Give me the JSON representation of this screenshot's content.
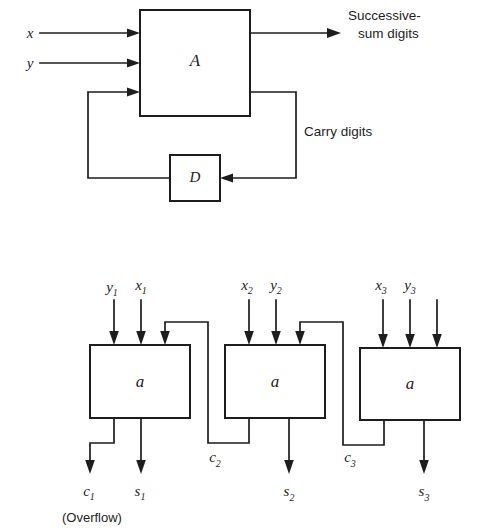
{
  "figure": {
    "background_color": "#ffffff",
    "line_color": "#1d1d1d",
    "top_diagram": {
      "name": "serial-adder-block-diagram",
      "boxes": [
        {
          "id": "adder",
          "label": "A",
          "x": 140,
          "y": 10,
          "w": 110,
          "h": 106
        },
        {
          "id": "delay",
          "label": "D",
          "x": 170,
          "y": 155,
          "w": 50,
          "h": 46
        }
      ],
      "inputs": [
        {
          "label": "x",
          "y": 36
        },
        {
          "label": "y",
          "y": 68
        }
      ],
      "outputs": [
        {
          "id": "sum-output",
          "label_line1": "Successive-",
          "label_line2": "sum digits"
        },
        {
          "id": "carry-output",
          "label": "Carry digits"
        }
      ]
    },
    "bottom_diagram": {
      "name": "parallel-ripple-carry-adder-diagram",
      "stages": [
        {
          "id": "stage-1",
          "box_label": "a",
          "x": 90,
          "y": 345,
          "w": 100,
          "h": 73,
          "inputs": [
            "y",
            "x"
          ],
          "input_subscripts": [
            "1",
            "1"
          ],
          "carry_out": "c",
          "carry_out_subscript": "1",
          "sum_out": "s",
          "sum_out_subscript": "1",
          "note": "(Overflow)"
        },
        {
          "id": "stage-2",
          "box_label": "a",
          "x": 225,
          "y": 345,
          "w": 100,
          "h": 73,
          "inputs": [
            "x",
            "y"
          ],
          "input_subscripts": [
            "2",
            "2"
          ],
          "carry_out": "c",
          "carry_out_subscript": "2",
          "sum_out": "s",
          "sum_out_subscript": "2",
          "note": ""
        },
        {
          "id": "stage-3",
          "box_label": "a",
          "x": 360,
          "y": 348,
          "w": 100,
          "h": 72,
          "inputs": [
            "x",
            "y"
          ],
          "input_subscripts": [
            "3",
            "3"
          ],
          "carry_out": "c",
          "carry_out_subscript": "3",
          "sum_out": "s",
          "sum_out_subscript": "3",
          "note": ""
        }
      ],
      "overflow_note": "(Overflow)"
    }
  }
}
